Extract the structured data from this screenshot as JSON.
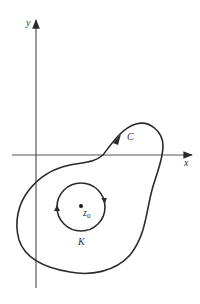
{
  "diagram": {
    "axes": {
      "x_label": "x",
      "y_label": "y"
    },
    "curves": {
      "outer_contour_label": "C",
      "inner_circle_label": "K"
    },
    "point": {
      "label_base": "z",
      "label_sub": "0"
    },
    "colors": {
      "stroke": "#2a2a2a",
      "axis": "#555555",
      "background": "#ffffff"
    }
  }
}
